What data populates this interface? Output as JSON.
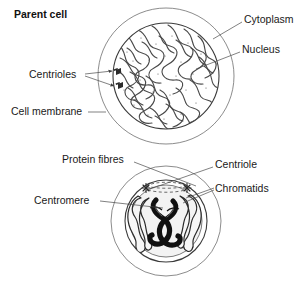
{
  "figure": {
    "title_label": "Parent cell",
    "background_color": "#ffffff",
    "ink_color": "#1a1a1a"
  },
  "upper_cell": {
    "name": "parent-cell-interphase",
    "labels": {
      "parent_cell": "Parent cell",
      "cytoplasm": "Cytoplasm",
      "nucleus": "Nucleus",
      "centrioles": "Centrioles",
      "cell_membrane": "Cell membrane"
    }
  },
  "lower_cell": {
    "name": "dividing-cell-prophase",
    "labels": {
      "protein_fibres": "Protein fibres",
      "centriole": "Centriole",
      "chromatids": "Chromatids",
      "centromere": "Centromere"
    }
  },
  "colors": {
    "membrane_stroke": "#6e6e6e",
    "nucleus_stroke": "#3b3b3b",
    "nucleus_fill": "#e8e8e8",
    "chromatin_stroke": "#4f4f4f",
    "chromosome_dark": "#111111",
    "leader_stroke": "#4a4a4a"
  }
}
